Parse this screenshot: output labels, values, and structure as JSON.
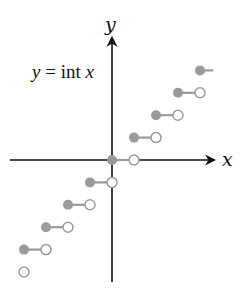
{
  "chart_data": {
    "type": "line",
    "subtype": "step",
    "title": "",
    "annotation": {
      "var": "y",
      "eq": " = ",
      "fn": "int ",
      "arg": "x"
    },
    "xlabel": "x",
    "ylabel": "y",
    "xlim": [
      -4.5,
      4.6
    ],
    "ylim": [
      -5.5,
      5.6
    ],
    "grid": false,
    "legend": null,
    "series": [
      {
        "name": "y = int x",
        "segments": [
          {
            "x_start": -5,
            "x_end": -4,
            "y": -5,
            "closed_start": false,
            "open_end": true,
            "note": "only open endpoint at x=-4 visible"
          },
          {
            "x_start": -4,
            "x_end": -3,
            "y": -4
          },
          {
            "x_start": -3,
            "x_end": -2,
            "y": -3
          },
          {
            "x_start": -2,
            "x_end": -1,
            "y": -2
          },
          {
            "x_start": -1,
            "x_end": 0,
            "y": -1
          },
          {
            "x_start": 0,
            "x_end": 1,
            "y": 0
          },
          {
            "x_start": 1,
            "x_end": 2,
            "y": 1
          },
          {
            "x_start": 2,
            "x_end": 3,
            "y": 2
          },
          {
            "x_start": 3,
            "x_end": 4,
            "y": 3
          },
          {
            "x_start": 4,
            "x_end": 4.6,
            "y": 4,
            "open_end": false,
            "note": "continues past frame"
          }
        ]
      }
    ],
    "colors": {
      "axis": "#111111",
      "step": "#9a9a9a",
      "closed_dot": "#9a9a9a",
      "open_dot_fill": "#ffffff",
      "open_dot_stroke": "#9a9a9a"
    }
  }
}
